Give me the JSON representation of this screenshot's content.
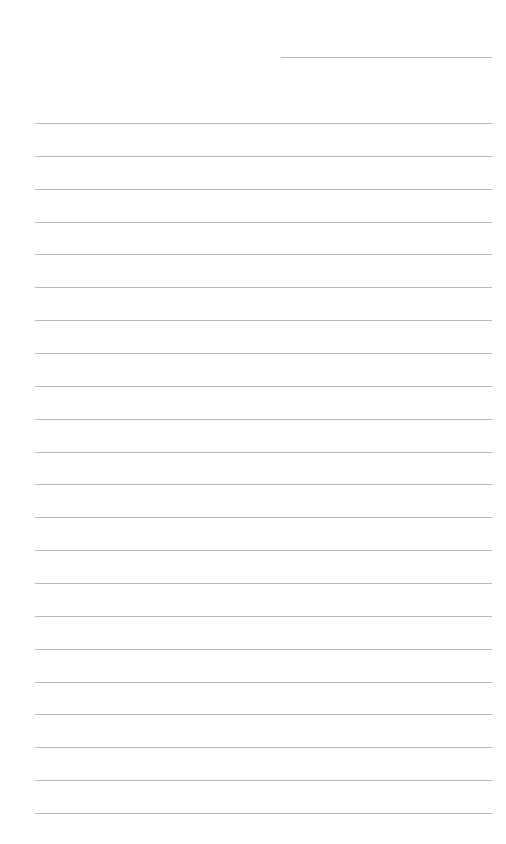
{
  "page": {
    "type": "lined-paper",
    "background_color": "#ffffff",
    "line_color": "#b8b8b8",
    "header_line": {
      "label": "date-line",
      "x": 281,
      "y": 57,
      "width": 211
    },
    "rules": {
      "count": 22,
      "x": 35,
      "width": 457,
      "first_y": 123,
      "spacing": 32.86
    }
  }
}
